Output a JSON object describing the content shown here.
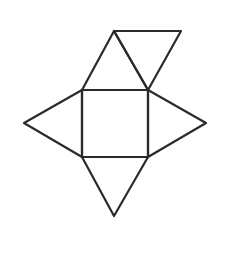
{
  "diagram": {
    "type": "pyramid-net",
    "stroke_color": "#2a2a2a",
    "stroke_width": 2.2,
    "background": "#ffffff",
    "shapes": [
      {
        "id": "center-square",
        "kind": "square",
        "points": [
          [
            82,
            90
          ],
          [
            148,
            90
          ],
          [
            148,
            157
          ],
          [
            82,
            157
          ]
        ]
      },
      {
        "id": "top-triangle",
        "kind": "triangle",
        "points": [
          [
            82,
            90
          ],
          [
            114,
            31
          ],
          [
            148,
            90
          ]
        ]
      },
      {
        "id": "top-right-triangle",
        "kind": "triangle",
        "points": [
          [
            114,
            31
          ],
          [
            181,
            31
          ],
          [
            148,
            90
          ]
        ]
      },
      {
        "id": "left-triangle",
        "kind": "triangle",
        "points": [
          [
            82,
            90
          ],
          [
            24,
            123
          ],
          [
            82,
            157
          ]
        ]
      },
      {
        "id": "right-triangle",
        "kind": "triangle",
        "points": [
          [
            148,
            90
          ],
          [
            206,
            123
          ],
          [
            148,
            157
          ]
        ]
      },
      {
        "id": "bottom-triangle",
        "kind": "triangle",
        "points": [
          [
            82,
            157
          ],
          [
            114,
            216
          ],
          [
            148,
            157
          ]
        ]
      }
    ]
  }
}
